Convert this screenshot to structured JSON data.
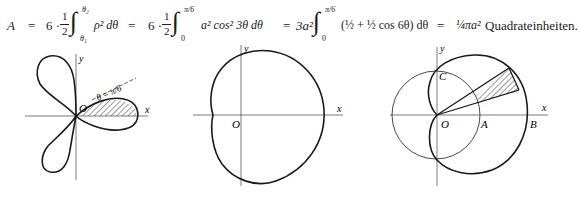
{
  "formula": {
    "lhs": "A",
    "eq": "=",
    "term1_coef": "6 · ",
    "term1_frac_num": "1",
    "term1_frac_den": "2",
    "term1_upper": "θ₂",
    "term1_lower": "θ₁",
    "term1_integrand": "ρ² dθ",
    "term2_coef": "6 · ",
    "term2_frac_num": "1",
    "term2_frac_den": "2",
    "term2_upper": "π/6",
    "term2_lower": "0",
    "term2_integrand": "a² cos² 3θ  dθ",
    "term3_coef": "3a²",
    "term3_upper": "π/6",
    "term3_lower": "0",
    "term3_integrand": "(½ + ½ cos 6θ) dθ",
    "result": "¼πa²",
    "unit": "Quadrateinheiten."
  },
  "figures": [
    {
      "id": "three-leaved-rose",
      "labels": {
        "x": "x",
        "y": "y",
        "origin": "O",
        "angle": "θ = π/6"
      },
      "curve": "ρ = a cos 3θ",
      "shaded": "region 0 ≤ θ ≤ π/6"
    },
    {
      "id": "limacon",
      "labels": {
        "x": "x",
        "y": "y",
        "origin": "O"
      }
    },
    {
      "id": "cardioid-and-circle",
      "labels": {
        "x": "x",
        "y": "y",
        "origin": "O",
        "A": "A",
        "B": "B",
        "C": "C"
      },
      "shaded": "region between circle and cardioid within a thin angular sector"
    }
  ]
}
